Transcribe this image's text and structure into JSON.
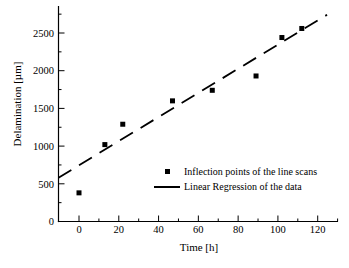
{
  "chart_data": {
    "type": "scatter",
    "title": "",
    "xlabel": "Time [h]",
    "ylabel": "Delamination [µm]",
    "xlim": [
      -10.6,
      131
    ],
    "ylim": [
      0,
      2860
    ],
    "grid": false,
    "legend_position": "inside-center-right",
    "x_major_ticks": [
      0,
      20,
      40,
      60,
      80,
      100,
      120
    ],
    "x_minor_ticks": [
      10,
      30,
      50,
      70,
      90,
      110,
      130
    ],
    "y_major_ticks": [
      0,
      500,
      1000,
      1500,
      2000,
      2500
    ],
    "y_minor_ticks": [
      250,
      750,
      1250,
      1750,
      2250,
      2750
    ],
    "series": [
      {
        "name": "Inflection points of the line scans",
        "type": "scatter",
        "marker": "square",
        "marker_size_px": 5,
        "color": "#000000",
        "points": [
          [
            0,
            380
          ],
          [
            13,
            1020
          ],
          [
            22,
            1290
          ],
          [
            47,
            1600
          ],
          [
            67,
            1740
          ],
          [
            89,
            1930
          ],
          [
            102,
            2440
          ],
          [
            112,
            2560
          ]
        ]
      },
      {
        "name": "Linear Regression of the data",
        "type": "line",
        "style": "dashed",
        "color": "#000000",
        "slope": 16.0,
        "intercept": 746,
        "t_start": -10.3,
        "t_end": 124.7
      }
    ]
  },
  "colors": {
    "foreground": "#000000",
    "background": "#ffffff"
  }
}
